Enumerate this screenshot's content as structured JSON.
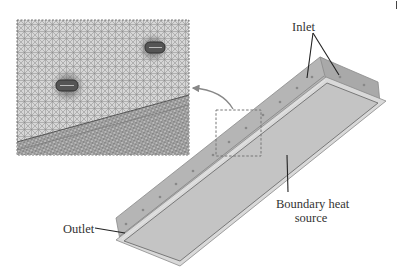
{
  "figure": {
    "labels": {
      "inlet": "Inlet",
      "outlet": "Outlet",
      "heat_source_line1": "Boundary heat",
      "heat_source_line2": "source"
    },
    "colors": {
      "background": "#ffffff",
      "tray_wall": "#b8b8b8",
      "tray_plate": "#c4c4c4",
      "tray_rim": "#d9d9d9",
      "mesh": "#8a8a8a",
      "leader_line": "#222222",
      "callout_box": "#777777"
    },
    "inset": {
      "description": "zoomed mesh view of inlet holes",
      "x": 17,
      "y": 20,
      "width": 172,
      "height": 135
    },
    "callout_box": {
      "x": 217,
      "y": 110,
      "width": 45,
      "height": 46,
      "style": "dashed"
    }
  }
}
